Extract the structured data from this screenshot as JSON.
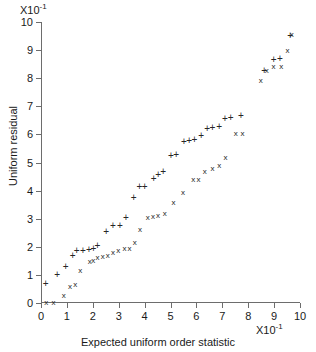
{
  "chart_data": {
    "type": "scatter",
    "title": "",
    "xlabel": "Expected uniform order statistic",
    "ylabel": "Uniform residual",
    "x_exponent": "X10",
    "x_exponent_power": "-1",
    "y_exponent": "X10",
    "y_exponent_power": "-1",
    "xlim": [
      0,
      10
    ],
    "ylim": [
      0,
      10
    ],
    "xticks": [
      0,
      1,
      2,
      3,
      4,
      5,
      6,
      7,
      8,
      9,
      10
    ],
    "yticks": [
      0,
      1,
      2,
      3,
      4,
      5,
      6,
      7,
      8,
      9,
      10
    ],
    "xticklabels": [
      "0",
      "1",
      "2",
      "3",
      "4",
      "5",
      "6",
      "7",
      "8",
      "9",
      "10"
    ],
    "yticklabels": [
      "0",
      "1",
      "2",
      "3",
      "4",
      "5",
      "6",
      "7",
      "8",
      "9",
      "10"
    ],
    "grid": false,
    "legend": "none",
    "marker_color": "#262626",
    "axis_color": "#6d6d6d",
    "series": [
      {
        "name": "plus-series",
        "marker": "+",
        "points": [
          [
            0.18,
            0.72
          ],
          [
            0.62,
            1.02
          ],
          [
            0.95,
            1.3
          ],
          [
            1.22,
            1.72
          ],
          [
            1.38,
            1.88
          ],
          [
            1.62,
            1.9
          ],
          [
            1.85,
            1.92
          ],
          [
            2.02,
            1.97
          ],
          [
            2.18,
            2.05
          ],
          [
            2.52,
            2.58
          ],
          [
            2.78,
            2.78
          ],
          [
            3.05,
            2.78
          ],
          [
            3.28,
            3.05
          ],
          [
            3.58,
            3.78
          ],
          [
            3.8,
            4.18
          ],
          [
            4.0,
            4.18
          ],
          [
            4.35,
            4.45
          ],
          [
            4.52,
            4.58
          ],
          [
            4.72,
            4.7
          ],
          [
            5.02,
            5.28
          ],
          [
            5.22,
            5.3
          ],
          [
            5.52,
            5.78
          ],
          [
            5.72,
            5.8
          ],
          [
            5.92,
            5.82
          ],
          [
            6.18,
            5.98
          ],
          [
            6.42,
            6.22
          ],
          [
            6.62,
            6.25
          ],
          [
            6.88,
            6.3
          ],
          [
            7.1,
            6.6
          ],
          [
            7.32,
            6.62
          ],
          [
            7.72,
            6.7
          ],
          [
            8.62,
            8.28
          ],
          [
            8.98,
            8.7
          ],
          [
            9.22,
            8.72
          ],
          [
            9.62,
            9.55
          ]
        ]
      },
      {
        "name": "x-series",
        "marker": "x",
        "points": [
          [
            0.2,
            0.02
          ],
          [
            0.48,
            0.02
          ],
          [
            0.88,
            0.3
          ],
          [
            1.12,
            0.62
          ],
          [
            1.32,
            0.68
          ],
          [
            1.52,
            1.18
          ],
          [
            1.88,
            1.48
          ],
          [
            2.02,
            1.52
          ],
          [
            2.18,
            1.62
          ],
          [
            2.38,
            1.68
          ],
          [
            2.58,
            1.7
          ],
          [
            2.78,
            1.82
          ],
          [
            2.98,
            1.88
          ],
          [
            3.22,
            1.95
          ],
          [
            3.42,
            1.95
          ],
          [
            3.62,
            2.18
          ],
          [
            3.82,
            2.62
          ],
          [
            4.12,
            3.05
          ],
          [
            4.32,
            3.1
          ],
          [
            4.52,
            3.12
          ],
          [
            4.78,
            3.22
          ],
          [
            5.12,
            3.58
          ],
          [
            5.48,
            3.95
          ],
          [
            5.88,
            4.4
          ],
          [
            6.08,
            4.42
          ],
          [
            6.32,
            4.7
          ],
          [
            6.62,
            4.82
          ],
          [
            6.88,
            4.92
          ],
          [
            7.12,
            5.2
          ],
          [
            7.52,
            6.05
          ],
          [
            7.78,
            6.05
          ],
          [
            8.48,
            7.95
          ],
          [
            8.72,
            8.3
          ],
          [
            8.98,
            8.42
          ],
          [
            9.28,
            8.45
          ],
          [
            9.52,
            9.02
          ],
          [
            9.68,
            9.58
          ]
        ]
      }
    ]
  }
}
